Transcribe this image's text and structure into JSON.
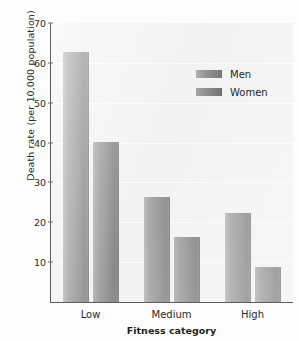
{
  "chart_data": {
    "type": "bar",
    "title": "",
    "xlabel": "Fitness category",
    "ylabel": "Death rate (per 10,000 population)",
    "categories": [
      "Low",
      "Medium",
      "High"
    ],
    "series": [
      {
        "name": "Men",
        "values": [
          62.8,
          26.3,
          22.3
        ]
      },
      {
        "name": "Women",
        "values": [
          40.2,
          16.3,
          8.7
        ]
      }
    ],
    "ylim": [
      0,
      70
    ],
    "yticks": [
      10,
      20,
      30,
      40,
      50,
      60,
      70
    ],
    "ytick_labels": [
      "10",
      "20",
      "30",
      "40",
      "50",
      "60",
      "70"
    ],
    "grid": true,
    "legend_position": "upper right",
    "colors": {
      "men": "#8c8c8c",
      "women": "#858585",
      "plot_background": "#f2f2f2",
      "axis": "#5d5d5d",
      "gridline": "#ffffff",
      "text": "#2b2b2b"
    }
  }
}
